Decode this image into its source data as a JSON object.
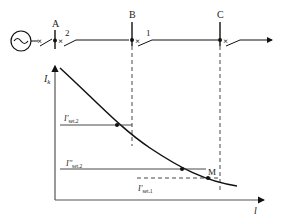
{
  "diagram": {
    "title": "",
    "single_line": {
      "source_label": "~",
      "buses": [
        {
          "id": "A",
          "label": "A"
        },
        {
          "id": "B",
          "label": "B"
        },
        {
          "id": "C",
          "label": "C"
        }
      ],
      "protections": [
        {
          "id": "2",
          "label": "2",
          "location": "A"
        },
        {
          "id": "1",
          "label": "1",
          "location": "B"
        }
      ]
    },
    "plot": {
      "y_axis_label": "I",
      "y_axis_sub": "k",
      "x_axis_label": "l",
      "curve": "fault current Ik vs. distance l (decreasing)",
      "levels": [
        {
          "label": "I'",
          "sub": "set.2"
        },
        {
          "label": "I''",
          "sub": "set.2"
        },
        {
          "label": "I'",
          "sub": "set.1"
        }
      ],
      "point_label": "M"
    }
  }
}
